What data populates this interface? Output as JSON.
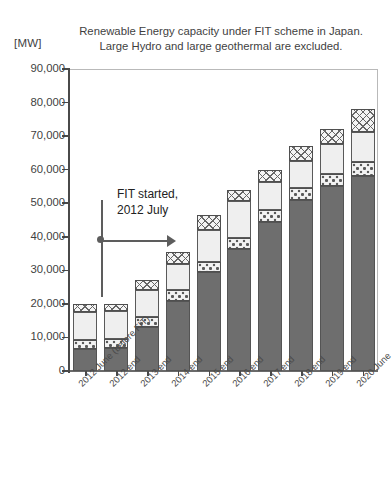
{
  "chart_data": {
    "type": "bar",
    "subtype": "stacked-bar",
    "title": "Renewable Energy capacity under FIT scheme  in Japan. Large Hydro and large geothermal are excluded.",
    "title_lines": [
      "Renewable Energy capacity under  FIT scheme  in Japan.",
      "Large Hydro and large geothermal are excluded."
    ],
    "unit_label": "[MW]",
    "xlabel": "",
    "ylabel": "",
    "ylim": [
      0,
      90000
    ],
    "ytick_values": [
      0,
      10000,
      20000,
      30000,
      40000,
      50000,
      60000,
      70000,
      80000,
      90000
    ],
    "ytick_labels": [
      "0",
      "10,000",
      "20,000",
      "30,000",
      "40,000",
      "50,000",
      "60,000",
      "70,000",
      "80,000",
      "90,000"
    ],
    "grid": false,
    "legend": null,
    "categories": [
      "2012 June (before FIT)",
      "2012 end",
      "2013 end",
      "2014 end",
      "2015 end",
      "2016 end",
      "2017 end",
      "2018 end",
      "2019 end",
      "2020 June"
    ],
    "series": [
      {
        "name": "solar",
        "pattern": "solid-dark-gray",
        "values": [
          6500,
          6800,
          13200,
          21000,
          29500,
          36500,
          44500,
          51000,
          55000,
          58000
        ]
      },
      {
        "name": "wind",
        "pattern": "dotted",
        "values": [
          2600,
          2700,
          2800,
          3000,
          3100,
          3200,
          3400,
          3600,
          3800,
          4200
        ]
      },
      {
        "name": "biomass",
        "pattern": "light-plain",
        "values": [
          8500,
          8300,
          8000,
          8000,
          9500,
          11000,
          8500,
          8000,
          9000,
          9000
        ]
      },
      {
        "name": "hydro",
        "pattern": "crosshatch",
        "values": [
          2400,
          2200,
          3000,
          3500,
          4400,
          3300,
          3600,
          4400,
          4200,
          6800
        ]
      }
    ],
    "totals": [
      20000,
      20000,
      27000,
      35500,
      46500,
      54000,
      60000,
      67000,
      72000,
      78000
    ],
    "annotations": [
      {
        "id": "fit-start",
        "text_lines": [
          "FIT started,",
          "2012 July"
        ],
        "marker": "vertical-line-with-right-arrow",
        "x_position_category": "2012 end"
      }
    ]
  }
}
